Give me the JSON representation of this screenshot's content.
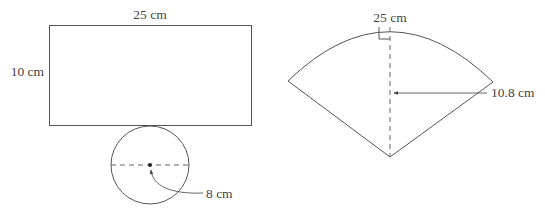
{
  "figure": {
    "left_net": {
      "rectangle": {
        "width_label": "25 cm",
        "height_label": "10 cm"
      },
      "circle": {
        "radius_label": "8 cm"
      }
    },
    "right_net": {
      "sector": {
        "arc_label": "25 cm",
        "radius_label": "10.8 cm",
        "right_angle_marker": true
      }
    }
  },
  "colors": {
    "stroke": "#555555",
    "text": "#444444",
    "background": "#ffffff"
  }
}
